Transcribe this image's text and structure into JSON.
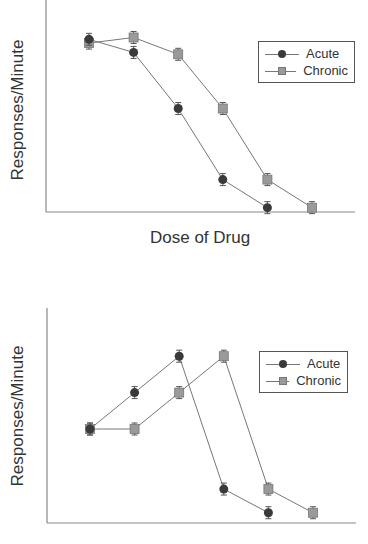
{
  "colors": {
    "acute": "#3a3a3a",
    "chronic": "#9a9a9a",
    "line": "#777777",
    "axis": "#888888"
  },
  "chart_data": [
    {
      "type": "line",
      "title": "",
      "xlabel": "Dose of Drug",
      "ylabel": "Responses/Minute",
      "grid": false,
      "legend_position": "upper right",
      "x": [
        1,
        2,
        3,
        4,
        5,
        6
      ],
      "ylim": [
        0,
        100
      ],
      "series": [
        {
          "name": "Acute",
          "marker": "circle",
          "x": [
            1,
            2,
            3,
            4,
            5
          ],
          "values": [
            95,
            88,
            58,
            20,
            5
          ]
        },
        {
          "name": "Chronic",
          "marker": "square",
          "x": [
            1,
            2,
            3,
            4,
            5,
            6
          ],
          "values": [
            93,
            96,
            87,
            58,
            20,
            5
          ]
        }
      ]
    },
    {
      "type": "line",
      "title": "",
      "xlabel": "Dose of Drug",
      "ylabel": "Responses/Minute",
      "grid": false,
      "legend_position": "upper right",
      "x": [
        1,
        2,
        3,
        4,
        5,
        6
      ],
      "ylim": [
        0,
        100
      ],
      "series": [
        {
          "name": "Acute",
          "marker": "circle",
          "x": [
            1,
            2,
            3,
            4,
            5
          ],
          "values": [
            50,
            70,
            90,
            17,
            4
          ]
        },
        {
          "name": "Chronic",
          "marker": "square",
          "x": [
            1,
            2,
            3,
            4,
            5,
            6
          ],
          "values": [
            50,
            50,
            70,
            90,
            17,
            4
          ]
        }
      ]
    }
  ],
  "top": {
    "ylabel": "Responses/Minute",
    "xlabel": "Dose of Drug",
    "legend": [
      {
        "label": "Acute",
        "marker": "circle"
      },
      {
        "label": "Chronic",
        "marker": "square"
      }
    ]
  },
  "bottom": {
    "ylabel": "Responses/Minute",
    "legend": [
      {
        "label": "Acute",
        "marker": "circle"
      },
      {
        "label": "Chronic",
        "marker": "square"
      }
    ]
  }
}
